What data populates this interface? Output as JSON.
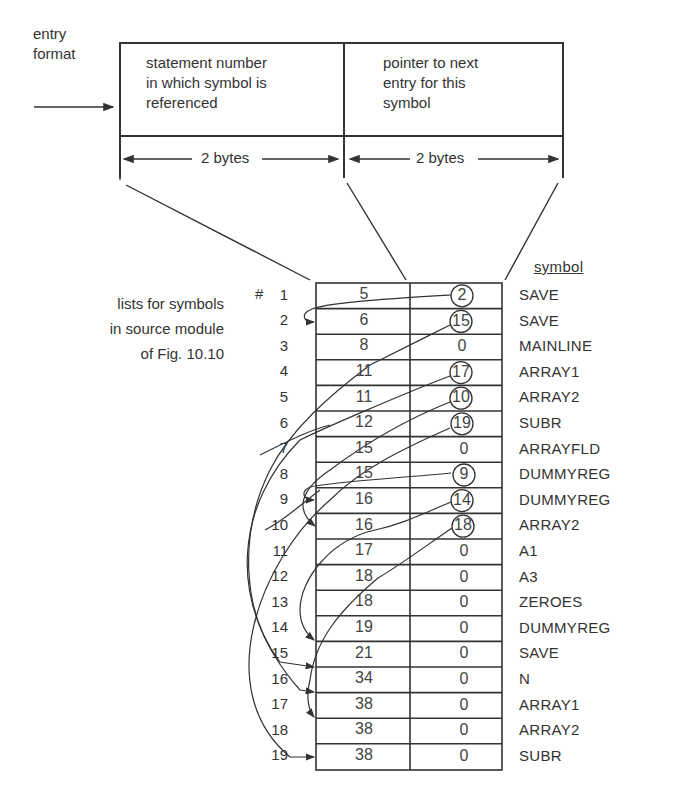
{
  "entry_format": {
    "label_line1": "entry",
    "label_line2": "format",
    "field1": {
      "line1": "statement number",
      "line2": "in which symbol is",
      "line3": "referenced",
      "size": "2 bytes"
    },
    "field2": {
      "line1": "pointer to next",
      "line2": "entry for this",
      "line3": "symbol",
      "size": "2 bytes"
    }
  },
  "caption": {
    "line1": "lists for symbols",
    "line2": "in source module",
    "line3": "of Fig. 10.10"
  },
  "table": {
    "symbol_header": "symbol",
    "first_index_prefix": "#",
    "rows": [
      {
        "index": "1",
        "statement": "5",
        "pointer": "2",
        "circled": true,
        "symbol": "SAVE"
      },
      {
        "index": "2",
        "statement": "6",
        "pointer": "15",
        "circled": true,
        "symbol": "SAVE"
      },
      {
        "index": "3",
        "statement": "8",
        "pointer": "0",
        "circled": false,
        "symbol": "MAINLINE"
      },
      {
        "index": "4",
        "statement": "11",
        "pointer": "17",
        "circled": true,
        "symbol": "ARRAY1"
      },
      {
        "index": "5",
        "statement": "11",
        "pointer": "10",
        "circled": true,
        "symbol": "ARRAY2"
      },
      {
        "index": "6",
        "statement": "12",
        "pointer": "19",
        "circled": true,
        "symbol": "SUBR"
      },
      {
        "index": "7",
        "statement": "15",
        "pointer": "0",
        "circled": false,
        "symbol": "ARRAYFLD"
      },
      {
        "index": "8",
        "statement": "15",
        "pointer": "9",
        "circled": true,
        "symbol": "DUMMYREG"
      },
      {
        "index": "9",
        "statement": "16",
        "pointer": "14",
        "circled": true,
        "symbol": "DUMMYREG"
      },
      {
        "index": "10",
        "statement": "16",
        "pointer": "18",
        "circled": true,
        "symbol": "ARRAY2"
      },
      {
        "index": "11",
        "statement": "17",
        "pointer": "0",
        "circled": false,
        "symbol": "A1"
      },
      {
        "index": "12",
        "statement": "18",
        "pointer": "0",
        "circled": false,
        "symbol": "A3"
      },
      {
        "index": "13",
        "statement": "18",
        "pointer": "0",
        "circled": false,
        "symbol": "ZEROES"
      },
      {
        "index": "14",
        "statement": "19",
        "pointer": "0",
        "circled": false,
        "symbol": "DUMMYREG"
      },
      {
        "index": "15",
        "statement": "21",
        "pointer": "0",
        "circled": false,
        "symbol": "SAVE"
      },
      {
        "index": "16",
        "statement": "34",
        "pointer": "0",
        "circled": false,
        "symbol": "N"
      },
      {
        "index": "17",
        "statement": "38",
        "pointer": "0",
        "circled": false,
        "symbol": "ARRAY1"
      },
      {
        "index": "18",
        "statement": "38",
        "pointer": "0",
        "circled": false,
        "symbol": "ARRAY2"
      },
      {
        "index": "19",
        "statement": "38",
        "pointer": "0",
        "circled": false,
        "symbol": "SUBR"
      }
    ]
  }
}
